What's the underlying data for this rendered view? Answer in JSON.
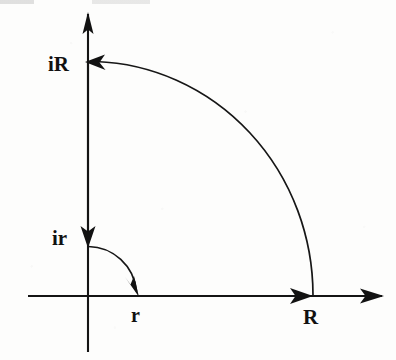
{
  "figure": {
    "background_color": "#fdfdfc",
    "ink_color": "#141414",
    "width": 396,
    "height": 360
  },
  "axes": {
    "origin": {
      "x": 88,
      "y": 296
    },
    "real_axis": {
      "name": "real-axis",
      "x_start": 28,
      "x_end": 382,
      "y": 296,
      "has_arrow_end": true
    },
    "imaginary_axis": {
      "name": "imaginary-axis",
      "x": 88,
      "y_top": 14,
      "y_bottom": 352,
      "has_arrow_top": true
    }
  },
  "labels": [
    {
      "id": "label-iR",
      "text": "iR",
      "x": 48,
      "y": 71,
      "describes": "outer radius on the imaginary axis"
    },
    {
      "id": "label-ir",
      "text": "ir",
      "x": 52,
      "y": 245,
      "describes": "inner radius on the imaginary axis"
    },
    {
      "id": "label-r",
      "text": "r",
      "x": 131,
      "y": 321,
      "describes": "inner radius on the real axis"
    },
    {
      "id": "label-R",
      "text": "R",
      "x": 303,
      "y": 323,
      "describes": "outer radius on the real axis"
    }
  ],
  "arcs": [
    {
      "id": "outer-arc",
      "name": "outer-arc-radius-R",
      "center_x": 88,
      "center_y": 296,
      "radius_x": 225,
      "radius_y": 234,
      "start": {
        "x": 313,
        "y": 296
      },
      "end": {
        "x": 95,
        "y": 62
      },
      "direction": "counterclockwise",
      "arrow_at": "end",
      "arrow_points": "left"
    },
    {
      "id": "inner-arc",
      "name": "inner-arc-radius-r",
      "center_x": 88,
      "center_y": 296,
      "radius_x": 49,
      "radius_y": 50,
      "start": {
        "x": 88,
        "y": 246
      },
      "end": {
        "x": 137,
        "y": 294
      },
      "direction": "clockwise",
      "arrow_at": "end",
      "arrow_points": "down-right"
    }
  ],
  "arrow_heads": [
    {
      "id": "arrow-imag-axis-top",
      "name": "imaginary-axis-arrowhead",
      "tip_x": 88,
      "tip_y": 14,
      "direction": "up"
    },
    {
      "id": "arrow-real-axis-end",
      "name": "real-axis-arrowhead",
      "tip_x": 382,
      "tip_y": 296,
      "direction": "right"
    },
    {
      "id": "arrow-at-R",
      "name": "contour-arrowhead-at-R",
      "tip_x": 312,
      "tip_y": 296,
      "direction": "right"
    },
    {
      "id": "arrow-at-iR",
      "name": "contour-arrowhead-at-iR",
      "tip_x": 86,
      "tip_y": 62,
      "direction": "left"
    },
    {
      "id": "arrow-at-ir",
      "name": "contour-arrowhead-at-ir",
      "tip_x": 88,
      "tip_y": 247,
      "direction": "down"
    },
    {
      "id": "arrow-inner-arc-end",
      "name": "inner-arc-arrowhead-at-r",
      "tip_x": 138,
      "tip_y": 296,
      "direction": "down-right"
    }
  ],
  "segments": [
    {
      "id": "segment-imag-down",
      "name": "contour-segment-iR-to-ir",
      "x1": 88,
      "y1": 62,
      "x2": 88,
      "y2": 247,
      "description": "descending segment along imaginary axis from iR to ir"
    },
    {
      "id": "segment-real-out",
      "name": "contour-segment-r-to-R",
      "x1": 137,
      "y1": 296,
      "x2": 312,
      "y2": 296,
      "description": "outgoing segment along real axis from r to R"
    }
  ]
}
